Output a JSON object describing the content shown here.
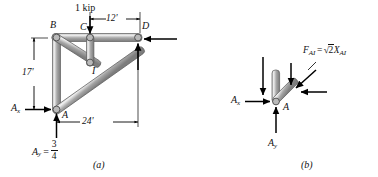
{
  "figure": {
    "title_a": "(a)",
    "title_b": "(b)"
  },
  "panel_a": {
    "caption": "(a)",
    "applied_load": {
      "label": "1 kip",
      "icon": "down-arrow-icon"
    },
    "joints": [
      {
        "id": "B",
        "label": "B"
      },
      {
        "id": "C",
        "label": "C"
      },
      {
        "id": "D",
        "label": "D"
      },
      {
        "id": "I",
        "label": "I"
      },
      {
        "id": "A",
        "label": "A"
      }
    ],
    "dimensions": [
      {
        "id": "height",
        "label": "17'"
      },
      {
        "id": "span-cd",
        "label": "12'"
      },
      {
        "id": "span-ad",
        "label": "24'"
      }
    ],
    "reactions": [
      {
        "id": "Ax",
        "base": "A",
        "sub": "x"
      },
      {
        "id": "Ay",
        "base": "A",
        "sub": "y",
        "eq": "=",
        "num": "3",
        "den": "4"
      }
    ],
    "member_color": "#9a9a9a",
    "member_light": "#d6d6d6",
    "member_dark": "#6f6f6f",
    "arrow_color": "#000000"
  },
  "panel_b": {
    "caption": "(b)",
    "joint_label": "A",
    "force_label": {
      "base": "F",
      "sub": "AI",
      "eq": "=",
      "radical": "√",
      "radicand": "2",
      "factor": "X",
      "factor_sub": "AI"
    },
    "reactions": [
      {
        "id": "Ax",
        "base": "A",
        "sub": "x"
      },
      {
        "id": "Ay",
        "base": "A",
        "sub": "y"
      }
    ],
    "member_color": "#9a9a9a",
    "member_light": "#d6d6d6",
    "member_dark": "#6f6f6f"
  }
}
